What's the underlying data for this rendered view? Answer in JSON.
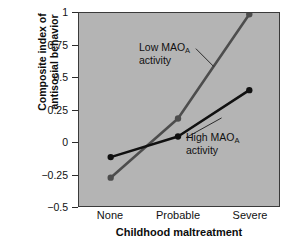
{
  "chart_data": {
    "type": "line",
    "title": "",
    "xlabel": "Childhood maltreatment",
    "ylabel": "Composite index of antisocial behavior",
    "ylabel_line1": "Composite index of",
    "ylabel_line2": "antisocial behavior",
    "categories": [
      "None",
      "Probable",
      "Severe"
    ],
    "ylim": [
      -0.5,
      1.0
    ],
    "yticks": [
      "1",
      "0.75",
      "0.5",
      "0.25",
      "0",
      "−0.25",
      "−0.5"
    ],
    "ytick_values": [
      1,
      0.75,
      0.5,
      0.25,
      0,
      -0.25,
      -0.5
    ],
    "grid": false,
    "legend": "annotations-on-plot",
    "plot_background": "#b4b4b4",
    "series": [
      {
        "name": "Low MAOA activity",
        "label_line1": "Low MAO",
        "label_sub": "A",
        "label_line2": "activity",
        "color": "#4d4d4d",
        "values": [
          -0.28,
          0.18,
          0.99
        ]
      },
      {
        "name": "High MAOA activity",
        "label_line1": "High MAO",
        "label_sub": "A",
        "label_line2": "activity",
        "color": "#111111",
        "values": [
          -0.12,
          0.04,
          0.4
        ]
      }
    ]
  }
}
